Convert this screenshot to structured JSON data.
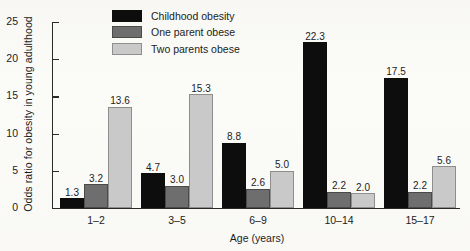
{
  "chart_data": {
    "type": "bar",
    "title": "",
    "xlabel": "Age (years)",
    "ylabel": "Odds ratio for obesity in young adulthood",
    "categories": [
      "1–2",
      "3–5",
      "6–9",
      "10–14",
      "15–17"
    ],
    "series": [
      {
        "name": "Childhood obesity",
        "color": "#0d0d0d",
        "values": [
          1.3,
          4.7,
          8.8,
          22.3,
          17.5
        ]
      },
      {
        "name": "One parent obese",
        "color": "#6e6e6e",
        "values": [
          3.2,
          3.0,
          2.6,
          2.2,
          2.2
        ]
      },
      {
        "name": "Two parents obese",
        "color": "#c9c9c9",
        "values": [
          13.6,
          15.3,
          5.0,
          2.0,
          5.6
        ]
      }
    ],
    "value_labels": [
      [
        "1.3",
        "3.2",
        "13.6"
      ],
      [
        "4.7",
        "3.0",
        "15.3"
      ],
      [
        "8.8",
        "2.6",
        "5.0"
      ],
      [
        "22.3",
        "2.2",
        "2.0"
      ],
      [
        "17.5",
        "2.2",
        "5.6"
      ]
    ],
    "ylim": [
      0,
      25
    ],
    "yticks": [
      0,
      5,
      10,
      15,
      20,
      25
    ],
    "ytick_labels": [
      "0",
      "5",
      "10",
      "15",
      "20",
      "25"
    ],
    "grid": false,
    "legend_position": "top-left-inside"
  }
}
